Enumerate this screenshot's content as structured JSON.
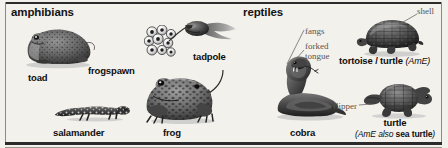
{
  "page": {
    "width": 448,
    "height": 148,
    "background_color": "#f3f1ec",
    "rule_color": "#2b2b2b",
    "text_color": "#0e0e0e",
    "callout_color": "#58544e"
  },
  "sections": {
    "amphibians": {
      "heading": "amphibians"
    },
    "reptiles": {
      "heading": "reptiles"
    }
  },
  "labels": {
    "toad": "toad",
    "frogspawn": "frogspawn",
    "tadpole": "tadpole",
    "salamander": "salamander",
    "frog": "frog",
    "cobra": "cobra",
    "tortoise_turtle_main": "tortoise / turtle ",
    "tortoise_turtle_variant": "(AmE)",
    "turtle_main": "turtle",
    "turtle_variant_prefix": "(AmE also ",
    "turtle_variant_bold": "sea turtle",
    "turtle_variant_suffix": ")"
  },
  "callouts": {
    "fangs": "fangs",
    "forked_line1": "forked",
    "forked_line2": "tongue",
    "shell": "shell",
    "flipper": "flipper"
  },
  "icons": {
    "toad": "toad-illustration",
    "frogspawn": "frogspawn-illustration",
    "tadpole": "tadpole-illustration",
    "salamander": "salamander-illustration",
    "frog": "frog-illustration",
    "cobra": "cobra-illustration",
    "tortoise": "tortoise-illustration",
    "sea_turtle": "sea-turtle-illustration"
  }
}
